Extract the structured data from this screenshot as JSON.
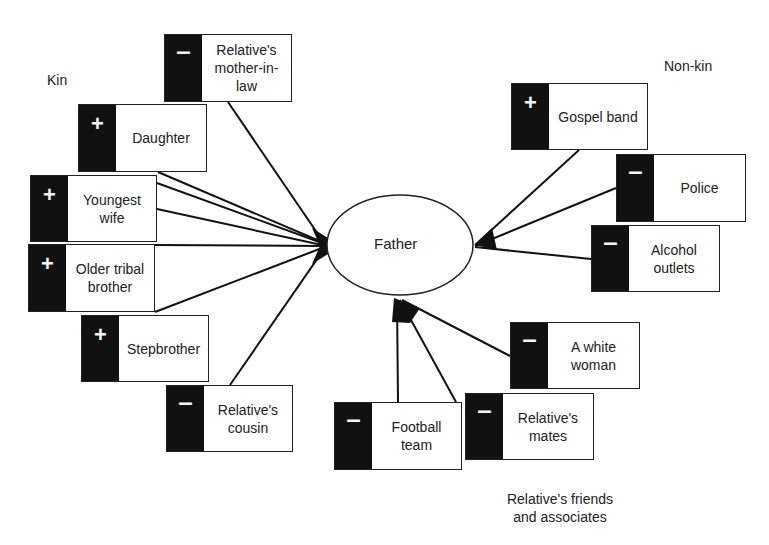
{
  "center": {
    "label": "Father",
    "cx": 400,
    "cy": 245,
    "rx": 73,
    "ry": 50
  },
  "groups": {
    "kin": {
      "label": "Kin"
    },
    "non_kin": {
      "label": "Non-kin"
    },
    "friends": {
      "label": "Relative's friends and associates"
    }
  },
  "nodes": [
    {
      "id": "mother-in-law",
      "label": "Relative's mother-in-law",
      "sign": "-",
      "group": "kin",
      "x": 164,
      "y": 34,
      "w": 128,
      "h": 68
    },
    {
      "id": "daughter",
      "label": "Daughter",
      "sign": "+",
      "group": "kin",
      "x": 78,
      "y": 104,
      "w": 129,
      "h": 68
    },
    {
      "id": "youngest-wife",
      "label": "Youngest wife",
      "sign": "+",
      "group": "kin",
      "x": 30,
      "y": 175,
      "w": 127,
      "h": 67
    },
    {
      "id": "older-tribal-brother",
      "label": "Older tribal brother",
      "sign": "+",
      "group": "kin",
      "x": 28,
      "y": 244,
      "w": 127,
      "h": 68
    },
    {
      "id": "stepbrother",
      "label": "Stepbrother",
      "sign": "+",
      "group": "kin",
      "x": 81,
      "y": 315,
      "w": 128,
      "h": 67
    },
    {
      "id": "relatives-cousin",
      "label": "Relative's cousin",
      "sign": "-",
      "group": "kin",
      "x": 166,
      "y": 385,
      "w": 127,
      "h": 67
    },
    {
      "id": "gospel-band",
      "label": "Gospel band",
      "sign": "+",
      "group": "non_kin",
      "x": 511,
      "y": 83,
      "w": 137,
      "h": 67
    },
    {
      "id": "police",
      "label": "Police",
      "sign": "-",
      "group": "non_kin",
      "x": 616,
      "y": 154,
      "w": 130,
      "h": 68
    },
    {
      "id": "alcohol-outlets",
      "label": "Alcohol outlets",
      "sign": "-",
      "group": "non_kin",
      "x": 591,
      "y": 225,
      "w": 129,
      "h": 67
    },
    {
      "id": "white-woman",
      "label": "A white woman",
      "sign": "-",
      "group": "friends",
      "x": 510,
      "y": 322,
      "w": 130,
      "h": 67
    },
    {
      "id": "relatives-mates",
      "label": "Relative's mates",
      "sign": "-",
      "group": "friends",
      "x": 465,
      "y": 393,
      "w": 129,
      "h": 67
    },
    {
      "id": "football-team",
      "label": "Football team",
      "sign": "-",
      "group": "friends",
      "x": 334,
      "y": 402,
      "w": 128,
      "h": 68
    }
  ],
  "edges": [
    {
      "from": "mother-in-law",
      "x1": 228,
      "y1": 102,
      "x2": 322,
      "y2": 240
    },
    {
      "from": "daughter",
      "x1": 158,
      "y1": 172,
      "x2": 322,
      "y2": 242
    },
    {
      "from": "youngest-wife",
      "x1": 157,
      "y1": 183,
      "x2": 322,
      "y2": 243
    },
    {
      "from": "youngest-wife",
      "x1": 157,
      "y1": 209,
      "x2": 322,
      "y2": 245
    },
    {
      "from": "older-tribal-brother",
      "x1": 155,
      "y1": 245,
      "x2": 322,
      "y2": 246
    },
    {
      "from": "older-tribal-brother",
      "x1": 155,
      "y1": 312,
      "x2": 322,
      "y2": 248
    },
    {
      "from": "relatives-cousin",
      "x1": 230,
      "y1": 385,
      "x2": 322,
      "y2": 252
    },
    {
      "from": "gospel-band",
      "x1": 579,
      "y1": 150,
      "x2": 475,
      "y2": 245
    },
    {
      "from": "police",
      "x1": 616,
      "y1": 188,
      "x2": 475,
      "y2": 246
    },
    {
      "from": "alcohol-outlets",
      "x1": 591,
      "y1": 259,
      "x2": 475,
      "y2": 247
    },
    {
      "from": "white-woman",
      "x1": 510,
      "y1": 356,
      "x2": 402,
      "y2": 300
    },
    {
      "from": "relatives-mates",
      "x1": 456,
      "y1": 402,
      "x2": 400,
      "y2": 300
    },
    {
      "from": "football-team",
      "x1": 398,
      "y1": 402,
      "x2": 397,
      "y2": 300
    }
  ],
  "arrowheads": [
    {
      "side": "left",
      "points": "312,228 328,238 328,254 312,264 320,246"
    },
    {
      "side": "right",
      "points": "475,245 492,228 497,250"
    },
    {
      "side": "bottom",
      "points": "394,298 420,308 410,323 392,322"
    }
  ]
}
